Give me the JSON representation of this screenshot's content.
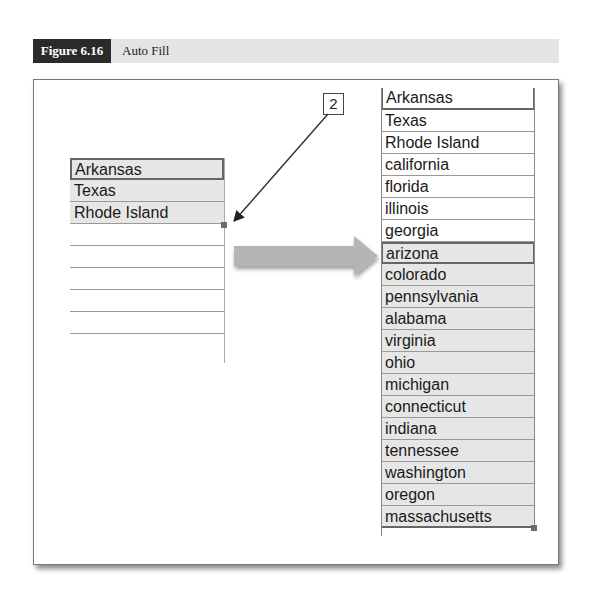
{
  "figure": {
    "number": "Figure 6.16",
    "title": "Auto Fill"
  },
  "callout": {
    "label": "2"
  },
  "before": {
    "cells": [
      "Arkansas",
      "Texas",
      "Rhode Island"
    ],
    "empty_rows": 6
  },
  "after": {
    "cells": [
      "Arkansas",
      "Texas",
      "Rhode Island",
      "california",
      "florida",
      "illinois",
      "georgia",
      "arizona",
      "colorado",
      "pennsylvania",
      "alabama",
      "virginia",
      "ohio",
      "michigan",
      "connecticut",
      "indiana",
      "tennessee",
      "washington",
      "oregon",
      "massachusetts"
    ],
    "selected_start_index": 7
  },
  "colors": {
    "header_dark": "#2a2a2a",
    "header_band": "#e4e4e4",
    "selection": "#e6e6e6",
    "arrow": "#b5b5b5"
  }
}
